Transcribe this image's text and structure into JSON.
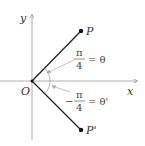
{
  "diagram": {
    "axes": {
      "x_label": "x",
      "y_label": "y",
      "origin_label": "O"
    },
    "points": [
      {
        "label": "P",
        "x": 81,
        "y": 31
      },
      {
        "label": "P'",
        "x": 81,
        "y": 130
      }
    ],
    "angles": [
      {
        "numerator": "π",
        "denominator": "4",
        "sign": "",
        "equals": "= θ"
      },
      {
        "numerator": "π",
        "denominator": "4",
        "sign": "−",
        "equals": "= θ'"
      }
    ],
    "colors": {
      "axis": "#888888",
      "ray": "#222222",
      "arrow": "#aaaaaa"
    }
  }
}
